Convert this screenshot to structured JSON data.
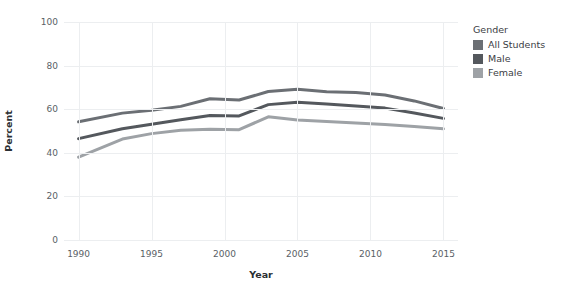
{
  "chart_data": {
    "type": "line",
    "title": "",
    "xlabel": "Year",
    "ylabel": "Percent",
    "xlim": [
      1989,
      2016
    ],
    "ylim": [
      0,
      100
    ],
    "grid": true,
    "legend_position": "right",
    "legend_title": "Gender",
    "xticks": [
      1990,
      1995,
      2000,
      2005,
      2010,
      2015
    ],
    "yticks": [
      0,
      20,
      40,
      60,
      80,
      100
    ],
    "x": [
      1990,
      1993,
      1995,
      1997,
      1999,
      2001,
      2003,
      2005,
      2007,
      2009,
      2011,
      2013,
      2015
    ],
    "series": [
      {
        "name": "All Students",
        "color": "#6b6f74",
        "values": [
          54.2,
          58.2,
          59.5,
          61.3,
          64.8,
          64.2,
          68.1,
          69.1,
          68.0,
          67.7,
          66.5,
          63.8,
          60.3
        ]
      },
      {
        "name": "Male",
        "color": "#54585d",
        "values": [
          46.5,
          51.0,
          53.1,
          55.2,
          57.1,
          56.9,
          62.1,
          63.2,
          62.4,
          61.5,
          60.5,
          58.3,
          55.8
        ]
      },
      {
        "name": "Female",
        "color": "#9ea2a6",
        "values": [
          38.0,
          46.3,
          48.8,
          50.3,
          50.8,
          50.6,
          56.5,
          55.0,
          54.4,
          53.7,
          53.0,
          52.1,
          51.0
        ]
      }
    ]
  }
}
